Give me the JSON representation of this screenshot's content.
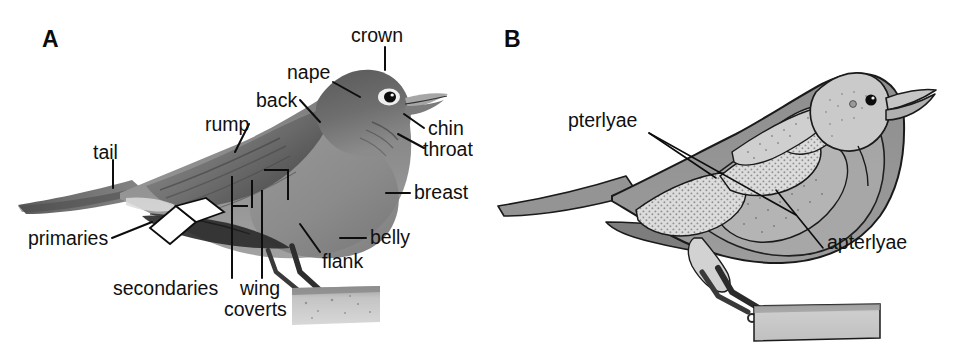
{
  "figure": {
    "background_color": "#ffffff",
    "text_color": "#101010"
  },
  "panels": [
    {
      "id": "A",
      "letter": "A",
      "subject": "american-robin-photograph-with-plumage-region-labels",
      "labels": [
        {
          "name": "crown",
          "text": "crown"
        },
        {
          "name": "nape",
          "text": "nape"
        },
        {
          "name": "back",
          "text": "back"
        },
        {
          "name": "rump",
          "text": "rump"
        },
        {
          "name": "tail",
          "text": "tail"
        },
        {
          "name": "chin",
          "text": "chin"
        },
        {
          "name": "throat",
          "text": "throat"
        },
        {
          "name": "breast",
          "text": "breast"
        },
        {
          "name": "belly",
          "text": "belly"
        },
        {
          "name": "flank",
          "text": "flank"
        },
        {
          "name": "primaries",
          "text": "primaries"
        },
        {
          "name": "secondaries",
          "text": "secondaries"
        },
        {
          "name": "wing-coverts-line1",
          "text": "wing"
        },
        {
          "name": "wing-coverts-line2",
          "text": "coverts"
        }
      ]
    },
    {
      "id": "B",
      "letter": "B",
      "subject": "bird-feather-tract-schematic",
      "labels": [
        {
          "name": "pterlyae",
          "text": "pterlyae"
        },
        {
          "name": "apterlyae",
          "text": "apterlyae"
        }
      ]
    }
  ],
  "colors": {
    "body_gray": "#8d8d8d",
    "body_gray_dark": "#6f6f6f",
    "tract_light": "#d5d5d5",
    "tract_mid": "#b9b9b9",
    "outline": "#1a1a1a",
    "perch_gray": "#c8c8c8",
    "leg_dark": "#3a3a3a",
    "text": "#101010",
    "background": "#ffffff"
  }
}
